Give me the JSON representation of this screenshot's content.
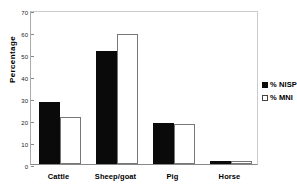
{
  "chart_data": {
    "type": "bar",
    "title": "",
    "subtitle": "",
    "xlabel": "",
    "ylabel": "Percentage",
    "ylim": [
      0,
      70
    ],
    "yticks": [
      0,
      10,
      20,
      30,
      40,
      50,
      60,
      70
    ],
    "ytick_labels": [
      "0",
      "10",
      "20",
      "30",
      "40",
      "50",
      "60",
      "70"
    ],
    "grid": false,
    "legend_position": "right",
    "categories": [
      "Cattle",
      "Sheep/goat",
      "Pig",
      "Horse"
    ],
    "series": [
      {
        "name": "% NISP",
        "color": "#0a0a0a",
        "values": [
          28.0,
          51.4,
          18.6,
          1.3
        ]
      },
      {
        "name": "% MNI",
        "color": "#ffffff",
        "values": [
          21.4,
          59.0,
          18.4,
          1.2
        ]
      }
    ]
  },
  "legend": {
    "items": [
      {
        "label": "% NISP",
        "swatch": "filled-square-icon"
      },
      {
        "label": "% MNI",
        "swatch": "hollow-square-icon"
      }
    ]
  },
  "axes": {
    "y_title": "Percentage"
  }
}
